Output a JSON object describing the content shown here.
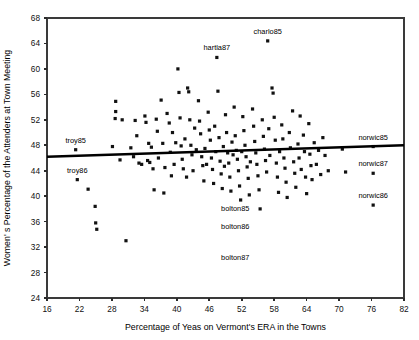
{
  "chart_data": {
    "type": "scatter",
    "title": "",
    "xlabel": "Percentage of Yeas on Vermont's ERA in the Towns",
    "ylabel": "Women' s Percentage of the Attenders at Town Meeting",
    "xlim": [
      16,
      82
    ],
    "ylim": [
      24,
      68
    ],
    "xticks": [
      16,
      22,
      28,
      34,
      40,
      46,
      52,
      58,
      64,
      70,
      76,
      82
    ],
    "yticks": [
      24,
      28,
      32,
      36,
      40,
      44,
      48,
      52,
      56,
      60,
      64,
      68
    ],
    "grid": false,
    "legend": "none",
    "marker": "square",
    "marker_color": "#111111",
    "trend_line": {
      "label": "regression-line",
      "x": [
        16,
        82
      ],
      "y": [
        46.2,
        48.0
      ],
      "color": "#000000"
    },
    "annotations": [
      {
        "label": "troy85",
        "x": 21.3,
        "y": 47.3,
        "dx": 0,
        "dy": -7
      },
      {
        "label": "troy86",
        "x": 21.6,
        "y": 42.6,
        "dx": 0,
        "dy": -7
      },
      {
        "label": "hartla87",
        "x": 47.4,
        "y": 61.8,
        "dx": 0,
        "dy": -7
      },
      {
        "label": "charlo85",
        "x": 56.8,
        "y": 64.4,
        "dx": 0,
        "dy": -7
      },
      {
        "label": "norwic85",
        "x": 76.3,
        "y": 47.8,
        "dx": 0,
        "dy": -7
      },
      {
        "label": "norwic87",
        "x": 76.3,
        "y": 43.6,
        "dx": 0,
        "dy": -7
      },
      {
        "label": "norwic86",
        "x": 76.3,
        "y": 38.6,
        "dx": 0,
        "dy": -7
      },
      {
        "label": "bolton85",
        "x": 50.8,
        "y": 36.5,
        "dx": 0,
        "dy": -7
      },
      {
        "label": "bolton86",
        "x": 50.8,
        "y": 33.7,
        "dx": 0,
        "dy": -7
      },
      {
        "label": "bolton87",
        "x": 50.8,
        "y": 28.8,
        "dx": 0,
        "dy": -7
      }
    ],
    "points": [
      [
        21.3,
        47.3
      ],
      [
        21.6,
        42.6
      ],
      [
        23.6,
        41.1
      ],
      [
        24.9,
        38.4
      ],
      [
        25.0,
        35.8
      ],
      [
        25.2,
        34.8
      ],
      [
        28.1,
        47.8
      ],
      [
        28.7,
        53.3
      ],
      [
        28.7,
        54.9
      ],
      [
        28.6,
        52.2
      ],
      [
        29.5,
        45.7
      ],
      [
        29.9,
        52.0
      ],
      [
        30.6,
        33.0
      ],
      [
        31.5,
        47.6
      ],
      [
        32.0,
        46.2
      ],
      [
        32.3,
        51.9
      ],
      [
        32.6,
        49.5
      ],
      [
        33.0,
        45.2
      ],
      [
        33.5,
        45.0
      ],
      [
        34.1,
        52.6
      ],
      [
        34.3,
        51.6
      ],
      [
        34.6,
        45.6
      ],
      [
        34.8,
        48.3
      ],
      [
        35.0,
        45.3
      ],
      [
        35.3,
        47.7
      ],
      [
        35.6,
        44.3
      ],
      [
        35.8,
        41.0
      ],
      [
        36.2,
        52.1
      ],
      [
        36.4,
        50.2
      ],
      [
        36.6,
        46.0
      ],
      [
        37.1,
        55.1
      ],
      [
        37.4,
        48.3
      ],
      [
        37.6,
        40.5
      ],
      [
        37.8,
        44.5
      ],
      [
        38.2,
        53.0
      ],
      [
        38.6,
        51.5
      ],
      [
        38.8,
        46.9
      ],
      [
        39.0,
        43.2
      ],
      [
        39.2,
        50.0
      ],
      [
        39.5,
        45.0
      ],
      [
        39.8,
        48.4
      ],
      [
        40.2,
        60.0
      ],
      [
        40.4,
        56.3
      ],
      [
        40.6,
        52.3
      ],
      [
        40.8,
        47.9
      ],
      [
        41.0,
        45.8
      ],
      [
        41.2,
        44.3
      ],
      [
        41.5,
        49.0
      ],
      [
        41.8,
        43.0
      ],
      [
        42.0,
        57.0
      ],
      [
        42.2,
        56.4
      ],
      [
        42.4,
        52.0
      ],
      [
        42.6,
        48.0
      ],
      [
        42.8,
        46.5
      ],
      [
        43.0,
        44.0
      ],
      [
        43.3,
        50.7
      ],
      [
        43.6,
        47.3
      ],
      [
        44.0,
        55.0
      ],
      [
        44.2,
        51.8
      ],
      [
        44.4,
        49.8
      ],
      [
        44.6,
        46.2
      ],
      [
        44.8,
        44.8
      ],
      [
        45.0,
        42.4
      ],
      [
        45.2,
        47.5
      ],
      [
        45.5,
        45.0
      ],
      [
        45.8,
        53.2
      ],
      [
        46.0,
        50.4
      ],
      [
        46.2,
        48.8
      ],
      [
        46.4,
        46.0
      ],
      [
        46.6,
        44.2
      ],
      [
        46.8,
        42.0
      ],
      [
        47.0,
        51.0
      ],
      [
        47.2,
        47.0
      ],
      [
        47.4,
        61.8
      ],
      [
        47.6,
        56.5
      ],
      [
        47.8,
        49.2
      ],
      [
        48.0,
        45.5
      ],
      [
        48.2,
        43.5
      ],
      [
        48.4,
        41.2
      ],
      [
        48.6,
        47.8
      ],
      [
        48.8,
        44.7
      ],
      [
        49.0,
        52.8
      ],
      [
        49.2,
        50.0
      ],
      [
        49.4,
        46.8
      ],
      [
        49.6,
        45.2
      ],
      [
        49.8,
        43.0
      ],
      [
        50.0,
        40.8
      ],
      [
        50.2,
        48.5
      ],
      [
        50.4,
        46.5
      ],
      [
        50.6,
        54.0
      ],
      [
        50.8,
        49.5
      ],
      [
        51.0,
        47.2
      ],
      [
        51.2,
        45.8
      ],
      [
        51.4,
        44.0
      ],
      [
        51.6,
        41.6
      ],
      [
        51.8,
        39.4
      ],
      [
        52.0,
        47.0
      ],
      [
        52.2,
        52.5
      ],
      [
        52.4,
        50.3
      ],
      [
        52.6,
        48.0
      ],
      [
        52.8,
        46.2
      ],
      [
        53.0,
        44.6
      ],
      [
        53.2,
        42.8
      ],
      [
        53.4,
        40.2
      ],
      [
        53.6,
        45.4
      ],
      [
        54.0,
        53.7
      ],
      [
        54.2,
        51.0
      ],
      [
        54.4,
        48.6
      ],
      [
        54.6,
        46.8
      ],
      [
        54.8,
        45.0
      ],
      [
        55.0,
        43.2
      ],
      [
        55.2,
        41.0
      ],
      [
        55.4,
        38.0
      ],
      [
        55.8,
        52.0
      ],
      [
        56.0,
        49.4
      ],
      [
        56.2,
        47.4
      ],
      [
        56.4,
        45.6
      ],
      [
        56.6,
        43.8
      ],
      [
        56.8,
        64.4
      ],
      [
        57.0,
        50.6
      ],
      [
        57.2,
        46.4
      ],
      [
        57.6,
        57.0
      ],
      [
        57.8,
        56.2
      ],
      [
        58.0,
        52.4
      ],
      [
        58.2,
        48.8
      ],
      [
        58.4,
        45.2
      ],
      [
        58.6,
        43.0
      ],
      [
        58.8,
        40.6
      ],
      [
        59.0,
        47.0
      ],
      [
        59.4,
        51.2
      ],
      [
        59.6,
        49.0
      ],
      [
        59.8,
        46.0
      ],
      [
        60.0,
        44.4
      ],
      [
        60.2,
        42.2
      ],
      [
        60.4,
        39.8
      ],
      [
        60.8,
        50.0
      ],
      [
        61.0,
        47.6
      ],
      [
        61.4,
        53.4
      ],
      [
        61.6,
        45.4
      ],
      [
        61.8,
        43.6
      ],
      [
        62.0,
        41.4
      ],
      [
        62.4,
        48.2
      ],
      [
        62.6,
        46.0
      ],
      [
        62.8,
        52.6
      ],
      [
        63.0,
        44.2
      ],
      [
        63.4,
        49.6
      ],
      [
        63.6,
        47.0
      ],
      [
        63.8,
        43.0
      ],
      [
        64.0,
        40.4
      ],
      [
        64.4,
        51.4
      ],
      [
        64.6,
        46.6
      ],
      [
        64.8,
        44.8
      ],
      [
        65.0,
        42.6
      ],
      [
        65.4,
        48.4
      ],
      [
        65.8,
        45.0
      ],
      [
        66.2,
        47.2
      ],
      [
        66.6,
        43.4
      ],
      [
        67.0,
        49.2
      ],
      [
        67.4,
        46.4
      ],
      [
        68.0,
        44.0
      ],
      [
        70.6,
        47.4
      ],
      [
        71.2,
        43.8
      ],
      [
        76.3,
        47.8
      ],
      [
        76.3,
        43.6
      ],
      [
        76.3,
        38.6
      ]
    ]
  }
}
